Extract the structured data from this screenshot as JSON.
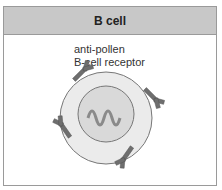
{
  "header": {
    "title": "B cell"
  },
  "labels": {
    "line1": "anti-pollen",
    "line2": "B-cell receptor"
  },
  "colors": {
    "header_bg": "#c8c8c8",
    "cell": "#e8e8e8",
    "nucleus": "#d8d8d8",
    "receptor": "#707070",
    "dna": "#909090"
  }
}
